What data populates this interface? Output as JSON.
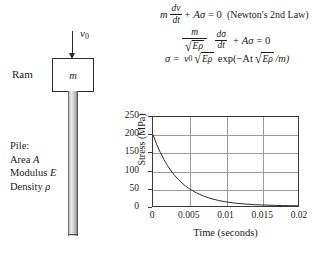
{
  "diagram": {
    "velocity_label": "v",
    "velocity_sub": "0",
    "ram_label": "Ram",
    "ram_mass_label": "m",
    "pile_title": "Pile:",
    "pile_area": "Area",
    "pile_area_sym": "A",
    "pile_modulus": "Modulus",
    "pile_modulus_sym": "E",
    "pile_density": "Density",
    "pile_density_sym": "ρ"
  },
  "equations": {
    "eq1": {
      "mass": "m",
      "frac_num": "dv",
      "frac_den": "dt",
      "plus": "+",
      "term": "Aσ",
      "equals": "= 0",
      "note": "(Newton's 2nd Law)"
    },
    "eq2": {
      "frac_num": "m",
      "sqrt_radicand": "Eρ",
      "frac2_num": "dσ",
      "frac2_den": "dt",
      "plus": "+",
      "term": "Aσ",
      "equals": "= 0"
    },
    "eq3": {
      "lhs": "σ =",
      "v0": "v",
      "v0_sub": "0",
      "sqrt_radicand": "Eρ",
      "exp_open": "exp(−At",
      "sqrt2_radicand": "Eρ",
      "exp_close": "/m)"
    }
  },
  "chart_data": {
    "type": "line",
    "title": "",
    "xlabel": "Time (seconds)",
    "ylabel": "Stress (MPa)",
    "xlim": [
      0,
      0.02
    ],
    "ylim": [
      0,
      250
    ],
    "xticks": [
      "0",
      "0.005",
      "0.01",
      "0.015",
      "0.02"
    ],
    "xtick_values": [
      0,
      0.005,
      0.01,
      0.015,
      0.02
    ],
    "yticks": [
      "0",
      "50",
      "100",
      "150",
      "200",
      "250"
    ],
    "ytick_values": [
      0,
      50,
      100,
      150,
      200,
      250
    ],
    "grid": "horizontal-and-vertical",
    "legend": "none",
    "series": [
      {
        "name": "Stress",
        "x": [
          0,
          0.0005,
          0.001,
          0.0015,
          0.002,
          0.0025,
          0.003,
          0.0035,
          0.004,
          0.0045,
          0.005,
          0.006,
          0.007,
          0.008,
          0.009,
          0.01,
          0.011,
          0.012,
          0.013,
          0.014,
          0.015,
          0.016,
          0.017,
          0.018,
          0.019,
          0.02
        ],
        "y": [
          200,
          173.6,
          150.7,
          130.8,
          113.6,
          98.6,
          85.6,
          74.3,
          64.5,
          56.0,
          48.6,
          36.7,
          27.6,
          20.8,
          15.7,
          11.8,
          8.9,
          6.7,
          5.1,
          3.8,
          2.9,
          2.2,
          1.6,
          1.2,
          0.9,
          0.7
        ]
      }
    ]
  }
}
